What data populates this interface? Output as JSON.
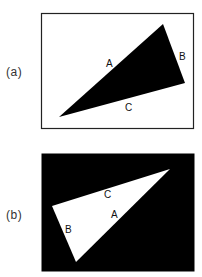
{
  "figure": {
    "panels": [
      {
        "id": "a",
        "label": "(a)",
        "label_pos": [
          6,
          76
        ],
        "frame": {
          "x": 41,
          "y": 13,
          "width": 152,
          "height": 115,
          "fill": "#ffffff",
          "stroke": "#222222"
        },
        "triangle": {
          "fill": "#000000",
          "points": [
            [
              163,
              24
            ],
            [
              185,
              83
            ],
            [
              59,
              117
            ]
          ]
        },
        "edge_labels": [
          {
            "text": "A",
            "x": 106,
            "y": 67,
            "color": "#111111"
          },
          {
            "text": "B",
            "x": 179,
            "y": 60,
            "color": "#111111"
          },
          {
            "text": "C",
            "x": 125,
            "y": 111,
            "color": "#111111"
          }
        ]
      },
      {
        "id": "b",
        "label": "(b)",
        "label_pos": [
          6,
          219
        ],
        "frame": {
          "x": 42,
          "y": 154,
          "width": 152,
          "height": 117,
          "fill": "#000000",
          "stroke": "#000000"
        },
        "triangle": {
          "fill": "#ffffff",
          "points": [
            [
              170,
              169
            ],
            [
              52,
              206
            ],
            [
              76,
              262
            ]
          ]
        },
        "edge_labels": [
          {
            "text": "C",
            "x": 104,
            "y": 198,
            "color": "#111111"
          },
          {
            "text": "A",
            "x": 111,
            "y": 218,
            "color": "#111111"
          },
          {
            "text": "B",
            "x": 65,
            "y": 233,
            "color": "#111111"
          }
        ]
      }
    ]
  }
}
